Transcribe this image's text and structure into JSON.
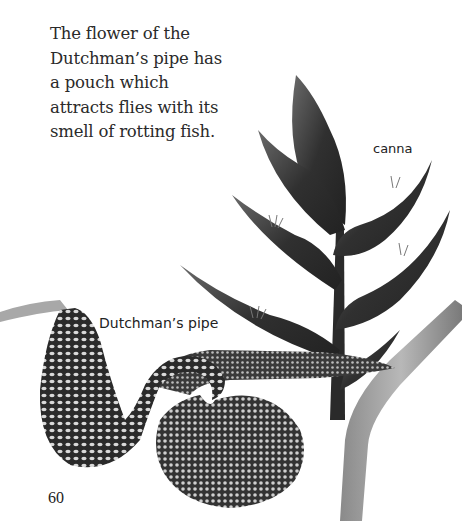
{
  "page": {
    "caption_lines": [
      "The flower of the",
      "Dutchman’s pipe has",
      "a pouch which",
      "attracts flies with its",
      "smell of rotting fish."
    ],
    "labels": {
      "canna": "canna",
      "dutchmans_pipe": "Dutchman’s pipe"
    },
    "page_number": "60"
  },
  "illustrations": [
    {
      "name": "canna",
      "style": "grayscale botanical drawing",
      "color": "#3a3a3a"
    },
    {
      "name": "dutchmans-pipe-flower",
      "style": "mottled netted pattern",
      "color": "#2e2e2e"
    }
  ],
  "colors": {
    "background": "#ffffff",
    "text": "#2a2a2a",
    "bract_dark": "#2f2f2f",
    "bract_mid": "#555555",
    "stem": "#9a9a9a",
    "pipe_light": "#d8d8d8"
  }
}
